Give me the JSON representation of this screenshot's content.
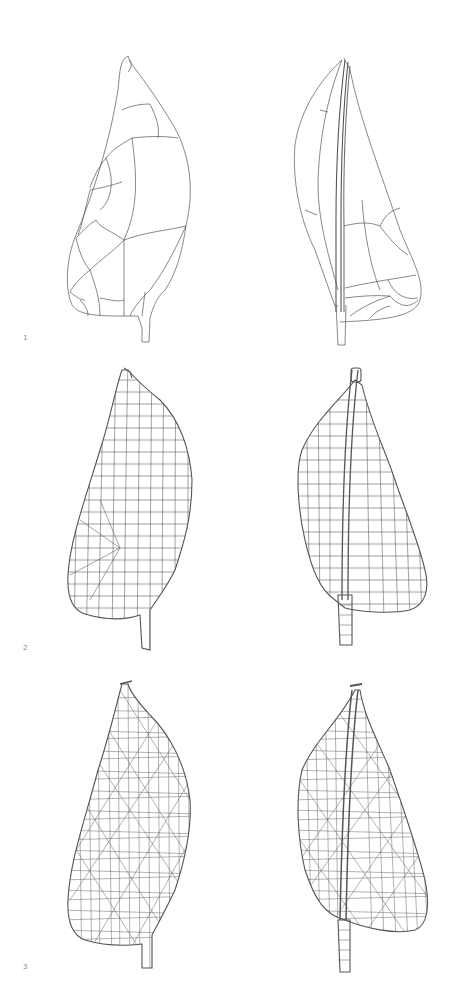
{
  "figure": {
    "rows": [
      {
        "label": "1",
        "mesh_density": "coarse",
        "views": [
          "leeward",
          "windward"
        ]
      },
      {
        "label": "2",
        "mesh_density": "medium",
        "views": [
          "leeward",
          "windward"
        ]
      },
      {
        "label": "3",
        "mesh_density": "fine",
        "views": [
          "leeward",
          "windward"
        ]
      }
    ],
    "colors": {
      "background": "#ffffff",
      "line": "#555555",
      "label": "#8a8a8a"
    }
  }
}
